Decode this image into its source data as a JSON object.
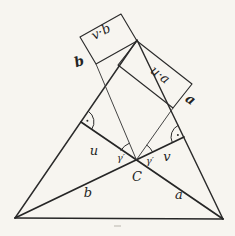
{
  "figure": {
    "kind": "hand-drawn geometry diagram",
    "background_color": "#f7f5f0",
    "ink_color": "#2b2b2b",
    "labels": {
      "rect_left_product": "v·b",
      "rect_left_side": "b",
      "rect_right_product": "u·a",
      "rect_right_side": "a",
      "altitude_segment_left": "u",
      "altitude_segment_right": "v",
      "angle_left": "γ′",
      "angle_right": "γ′",
      "vertex_c": "C",
      "triangle_side_b": "b",
      "triangle_side_a": "a"
    },
    "points": {
      "bottom_left_vertex": [
        15,
        218
      ],
      "bottom_right_vertex": [
        223,
        219
      ],
      "apex": [
        137,
        40
      ],
      "orthocenter_C": [
        136.4,
        159.8
      ],
      "foot_left_U": [
        81,
        122
      ],
      "foot_right_V": [
        184,
        137
      ],
      "rect_vb_corners": [
        [
          80,
          37
        ],
        [
          121,
          14
        ],
        [
          137,
          41
        ],
        [
          96,
          64
        ]
      ],
      "rect_ua_corners": [
        [
          137,
          41
        ],
        [
          192,
          84
        ],
        [
          173,
          108
        ],
        [
          118,
          65
        ]
      ]
    },
    "marks": {
      "right_angle_marks": "arc with dot at both altitude feet",
      "equal_angle_marks": "two arcs labeled γ′ at C"
    }
  }
}
